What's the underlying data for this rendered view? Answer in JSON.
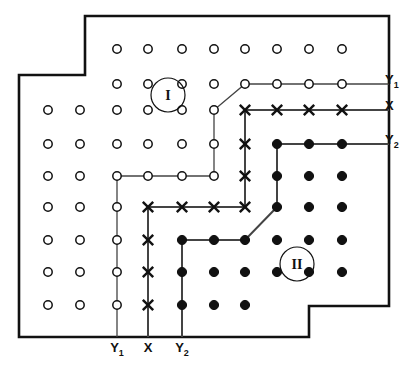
{
  "figure": {
    "background_color": "#ffffff",
    "ink_color": "#111111",
    "outline_color": "#111111",
    "path_color": "#444444"
  },
  "legend": {
    "open_circle": "open-circle-site",
    "cross": "cross-site",
    "filled_circle": "filled-circle-site"
  },
  "region_labels": [
    {
      "text": "I",
      "x": 168,
      "y": 95,
      "radius": 17
    },
    {
      "text": "II",
      "x": 297,
      "y": 264,
      "radius": 17
    }
  ],
  "right_axis_labels": [
    {
      "base": "Y",
      "sub": "1",
      "x": 385,
      "y": 84
    },
    {
      "base": "X",
      "sub": "",
      "x": 385,
      "y": 110
    },
    {
      "base": "Y",
      "sub": "2",
      "x": 385,
      "y": 144
    }
  ],
  "bottom_axis_labels": [
    {
      "base": "Y",
      "sub": "1",
      "x": 117,
      "y": 352
    },
    {
      "base": "X",
      "sub": "",
      "x": 148,
      "y": 352
    },
    {
      "base": "Y",
      "sub": "2",
      "x": 182,
      "y": 352
    }
  ],
  "outline": {
    "points": "85,16 389,16 389,306 309,306 309,337 19,337 19,75 85,75",
    "stroke_width": 2.6
  },
  "grid": {
    "columns_x": [
      48,
      80,
      117,
      148,
      182,
      214,
      245,
      277,
      309,
      342,
      374
    ],
    "rows_y": [
      49,
      84,
      110,
      144,
      176,
      207,
      240,
      272,
      305
    ],
    "open_radius": 4.2,
    "filled_radius": 4.6,
    "cross_size": 5.2
  },
  "sites": [
    {
      "type": "open",
      "col": 2,
      "row": 0
    },
    {
      "type": "open",
      "col": 3,
      "row": 0
    },
    {
      "type": "open",
      "col": 4,
      "row": 0
    },
    {
      "type": "open",
      "col": 5,
      "row": 0
    },
    {
      "type": "open",
      "col": 6,
      "row": 0
    },
    {
      "type": "open",
      "col": 7,
      "row": 0
    },
    {
      "type": "open",
      "col": 8,
      "row": 0
    },
    {
      "type": "open",
      "col": 9,
      "row": 0
    },
    {
      "type": "open",
      "col": 2,
      "row": 1
    },
    {
      "type": "open",
      "col": 3,
      "row": 1
    },
    {
      "type": "open",
      "col": 4,
      "row": 1
    },
    {
      "type": "open",
      "col": 5,
      "row": 1
    },
    {
      "type": "open",
      "col": 6,
      "row": 1
    },
    {
      "type": "open",
      "col": 7,
      "row": 1
    },
    {
      "type": "open",
      "col": 8,
      "row": 1
    },
    {
      "type": "open",
      "col": 9,
      "row": 1
    },
    {
      "type": "open",
      "col": 0,
      "row": 2
    },
    {
      "type": "open",
      "col": 1,
      "row": 2
    },
    {
      "type": "open",
      "col": 2,
      "row": 2
    },
    {
      "type": "open",
      "col": 3,
      "row": 2
    },
    {
      "type": "open",
      "col": 4,
      "row": 2
    },
    {
      "type": "open",
      "col": 5,
      "row": 2
    },
    {
      "type": "cross",
      "col": 6,
      "row": 2
    },
    {
      "type": "cross",
      "col": 7,
      "row": 2
    },
    {
      "type": "cross",
      "col": 8,
      "row": 2
    },
    {
      "type": "cross",
      "col": 9,
      "row": 2
    },
    {
      "type": "open",
      "col": 0,
      "row": 3
    },
    {
      "type": "open",
      "col": 1,
      "row": 3
    },
    {
      "type": "open",
      "col": 2,
      "row": 3
    },
    {
      "type": "open",
      "col": 3,
      "row": 3
    },
    {
      "type": "open",
      "col": 4,
      "row": 3
    },
    {
      "type": "open",
      "col": 5,
      "row": 3
    },
    {
      "type": "cross",
      "col": 6,
      "row": 3
    },
    {
      "type": "filled",
      "col": 7,
      "row": 3
    },
    {
      "type": "filled",
      "col": 8,
      "row": 3
    },
    {
      "type": "filled",
      "col": 9,
      "row": 3
    },
    {
      "type": "open",
      "col": 0,
      "row": 4
    },
    {
      "type": "open",
      "col": 1,
      "row": 4
    },
    {
      "type": "open",
      "col": 2,
      "row": 4
    },
    {
      "type": "open",
      "col": 3,
      "row": 4
    },
    {
      "type": "open",
      "col": 4,
      "row": 4
    },
    {
      "type": "open",
      "col": 5,
      "row": 4
    },
    {
      "type": "cross",
      "col": 6,
      "row": 4
    },
    {
      "type": "filled",
      "col": 7,
      "row": 4
    },
    {
      "type": "filled",
      "col": 8,
      "row": 4
    },
    {
      "type": "filled",
      "col": 9,
      "row": 4
    },
    {
      "type": "open",
      "col": 0,
      "row": 5
    },
    {
      "type": "open",
      "col": 1,
      "row": 5
    },
    {
      "type": "open",
      "col": 2,
      "row": 5
    },
    {
      "type": "cross",
      "col": 3,
      "row": 5
    },
    {
      "type": "cross",
      "col": 4,
      "row": 5
    },
    {
      "type": "cross",
      "col": 5,
      "row": 5
    },
    {
      "type": "cross",
      "col": 6,
      "row": 5
    },
    {
      "type": "filled",
      "col": 7,
      "row": 5
    },
    {
      "type": "filled",
      "col": 8,
      "row": 5
    },
    {
      "type": "filled",
      "col": 9,
      "row": 5
    },
    {
      "type": "open",
      "col": 0,
      "row": 6
    },
    {
      "type": "open",
      "col": 1,
      "row": 6
    },
    {
      "type": "open",
      "col": 2,
      "row": 6
    },
    {
      "type": "cross",
      "col": 3,
      "row": 6
    },
    {
      "type": "filled",
      "col": 4,
      "row": 6
    },
    {
      "type": "filled",
      "col": 5,
      "row": 6
    },
    {
      "type": "filled",
      "col": 6,
      "row": 6
    },
    {
      "type": "filled",
      "col": 7,
      "row": 6
    },
    {
      "type": "filled",
      "col": 8,
      "row": 6
    },
    {
      "type": "filled",
      "col": 9,
      "row": 6
    },
    {
      "type": "open",
      "col": 0,
      "row": 7
    },
    {
      "type": "open",
      "col": 1,
      "row": 7
    },
    {
      "type": "open",
      "col": 2,
      "row": 7
    },
    {
      "type": "cross",
      "col": 3,
      "row": 7
    },
    {
      "type": "filled",
      "col": 4,
      "row": 7
    },
    {
      "type": "filled",
      "col": 5,
      "row": 7
    },
    {
      "type": "filled",
      "col": 6,
      "row": 7
    },
    {
      "type": "filled",
      "col": 7,
      "row": 7
    },
    {
      "type": "filled",
      "col": 8,
      "row": 7
    },
    {
      "type": "filled",
      "col": 9,
      "row": 7
    },
    {
      "type": "open",
      "col": 0,
      "row": 8
    },
    {
      "type": "open",
      "col": 1,
      "row": 8
    },
    {
      "type": "open",
      "col": 2,
      "row": 8
    },
    {
      "type": "cross",
      "col": 3,
      "row": 8
    },
    {
      "type": "filled",
      "col": 4,
      "row": 8
    },
    {
      "type": "filled",
      "col": 5,
      "row": 8
    },
    {
      "type": "filled",
      "col": 6,
      "row": 8
    }
  ],
  "boundary_paths": [
    {
      "name": "y1-boundary",
      "stroke_width": 1.3,
      "points": "389,84 342,84 309,84 277,84 245,84 214,110 214,144 214,176 182,176 148,176 117,176 117,207 117,240 117,272 117,305 117,337"
    },
    {
      "name": "x-boundary",
      "stroke_width": 2.0,
      "points": "389,110 342,110 309,110 277,110 245,110 245,144 245,176 245,207 214,207 182,207 148,207 148,240 148,272 148,305 148,337"
    },
    {
      "name": "y2-boundary",
      "stroke_width": 2.0,
      "points": "389,144 342,144 309,144 277,144 277,176 277,207 245,240 214,240 182,240 182,272 182,305 182,337"
    }
  ]
}
